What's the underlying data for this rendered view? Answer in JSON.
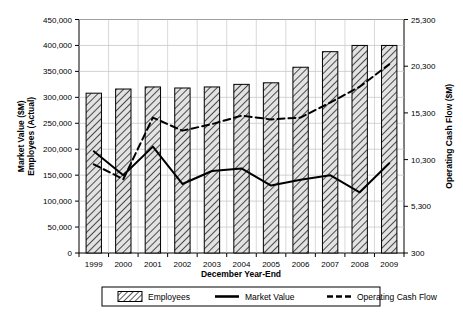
{
  "chart_data": {
    "type": "bar",
    "title": "",
    "xlabel": "December Year-End",
    "ylabel": "Market Value ($M) Employees (Actual)",
    "ylabel_line1": "Market Value ($M)",
    "ylabel_line2": "Employees (Actual)",
    "y2label": "Operating Cash Flow ($M)",
    "categories": [
      "1999",
      "2000",
      "2001",
      "2002",
      "2003",
      "2004",
      "2005",
      "2006",
      "2007",
      "2008",
      "2009"
    ],
    "ylim": [
      0,
      450000
    ],
    "yticks": [
      "0",
      "50,000",
      "100,000",
      "150,000",
      "200,000",
      "250,000",
      "300,000",
      "350,000",
      "400,000",
      "450,000"
    ],
    "ytick_values": [
      0,
      50000,
      100000,
      150000,
      200000,
      250000,
      300000,
      350000,
      400000,
      450000
    ],
    "y2lim": [
      300,
      25300
    ],
    "y2ticks": [
      "300",
      "5,300",
      "10,300",
      "15,300",
      "20,300",
      "25,300"
    ],
    "y2tick_values": [
      300,
      5300,
      10300,
      15300,
      20300,
      25300
    ],
    "grid": true,
    "legend_position": "bottom",
    "series": [
      {
        "name": "Employees",
        "type": "bar",
        "axis": "left",
        "values": [
          308000,
          316000,
          320000,
          318000,
          320000,
          325000,
          328000,
          358000,
          388000,
          400000,
          400000
        ]
      },
      {
        "name": "Market Value",
        "type": "line",
        "style": "solid",
        "axis": "left",
        "values": [
          196000,
          150000,
          205000,
          133000,
          158000,
          163000,
          130000,
          141000,
          150000,
          117000,
          173000
        ]
      },
      {
        "name": "Operating Cash Flow",
        "type": "line",
        "style": "dashed",
        "axis": "right",
        "values": [
          9800,
          8200,
          14800,
          13400,
          14100,
          15000,
          14600,
          14800,
          16400,
          18100,
          20500
        ]
      }
    ],
    "legend": [
      {
        "label": "Employees",
        "marker": "hatched-box"
      },
      {
        "label": "Market Value",
        "marker": "solid-line"
      },
      {
        "label": "Operating Cash Flow",
        "marker": "dashed-line"
      }
    ],
    "colors": {
      "bar_fill": "#d9d9d9",
      "bar_stroke": "#000000",
      "line": "#000000",
      "grid": "#c8c8c8",
      "axis": "#000000",
      "background": "#ffffff"
    }
  }
}
